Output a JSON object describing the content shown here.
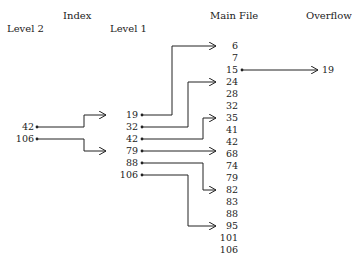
{
  "headers": {
    "index": "Index",
    "level2": "Level 2",
    "level1": "Level 1",
    "main_file": "Main File",
    "overflow": "Overflow"
  },
  "level2": [
    "42",
    "106"
  ],
  "level1": [
    "19",
    "32",
    "42",
    "79",
    "88",
    "106"
  ],
  "main_file": [
    "6",
    "7",
    "15",
    "24",
    "28",
    "32",
    "35",
    "41",
    "42",
    "68",
    "74",
    "79",
    "82",
    "83",
    "88",
    "95",
    "101",
    "106"
  ],
  "overflow": [
    "19"
  ],
  "pointers": {
    "level2_to_level1": [
      [
        "42",
        "19"
      ],
      [
        "106",
        "79"
      ]
    ],
    "level1_to_main": [
      [
        "19",
        "6"
      ],
      [
        "32",
        "24"
      ],
      [
        "42",
        "35"
      ],
      [
        "79",
        "68"
      ],
      [
        "88",
        "82"
      ],
      [
        "106",
        "95"
      ]
    ],
    "main_to_overflow": [
      [
        "15",
        "19"
      ]
    ]
  },
  "colors": {
    "line": "#222222",
    "text": "#222222"
  }
}
